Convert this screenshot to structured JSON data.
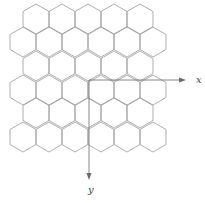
{
  "diagram": {
    "type": "hexagonal-lattice",
    "hex": {
      "orientation": "pointy-top",
      "radius": 15,
      "stroke": "#9a9a9a"
    },
    "rows": [
      {
        "cy": 19,
        "centers_x": [
          36,
          62,
          88,
          114,
          140
        ]
      },
      {
        "cy": 42,
        "centers_x": [
          23,
          49,
          75,
          101,
          127,
          153
        ]
      },
      {
        "cy": 66,
        "centers_x": [
          36,
          62,
          88,
          114,
          140
        ]
      },
      {
        "cy": 90,
        "centers_x": [
          23,
          49,
          75,
          101,
          127,
          153
        ]
      },
      {
        "cy": 113,
        "centers_x": [
          36,
          62,
          88,
          114,
          140
        ]
      },
      {
        "cy": 137,
        "centers_x": [
          23,
          49,
          75,
          101,
          127,
          153
        ]
      }
    ],
    "axes": {
      "origin": [
        89,
        80
      ],
      "x_axis": {
        "end": [
          186,
          80
        ],
        "label": "x",
        "label_pos": [
          196,
          83
        ]
      },
      "y_axis": {
        "end": [
          89,
          180
        ],
        "label": "y",
        "label_pos": [
          88,
          193
        ]
      },
      "color": "#6a6a6a"
    }
  }
}
